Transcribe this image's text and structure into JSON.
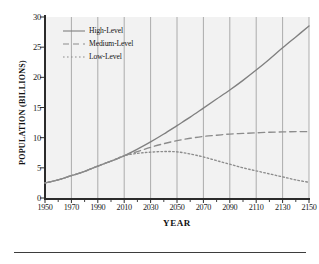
{
  "chart_data": {
    "type": "line",
    "title": "",
    "xlabel": "Year",
    "ylabel": "Population (Billions)",
    "xlim": [
      1950,
      2150
    ],
    "ylim": [
      0,
      30
    ],
    "xticks": [
      1950,
      1970,
      1990,
      2010,
      2030,
      2050,
      2070,
      2090,
      2110,
      2130,
      2150
    ],
    "xtick_labels": [
      "1950",
      "1970",
      "1990",
      "2010",
      "2030",
      "2050",
      "2070",
      "2090",
      "2110",
      "2130",
      "2150"
    ],
    "yticks": [
      0,
      5,
      10,
      15,
      20,
      25,
      30
    ],
    "ytick_labels": [
      "0",
      "5",
      "10",
      "15",
      "20",
      "25",
      "30"
    ],
    "minor_xtick_interval": 10,
    "grid": "vertical-only",
    "grid_color": "#999999",
    "plot_background": "#f2f2f2",
    "legend_position": "upper-left-inside",
    "x": [
      1950,
      1960,
      1970,
      1980,
      1990,
      2000,
      2010,
      2020,
      2030,
      2040,
      2050,
      2060,
      2070,
      2080,
      2090,
      2100,
      2110,
      2120,
      2130,
      2140,
      2150
    ],
    "series": [
      {
        "name": "High-Level",
        "style": "solid",
        "color": "#808080",
        "values": [
          2.5,
          3.0,
          3.7,
          4.4,
          5.3,
          6.1,
          7.0,
          8.1,
          9.3,
          10.6,
          12.0,
          13.4,
          14.9,
          16.4,
          17.9,
          19.5,
          21.2,
          23.0,
          24.9,
          26.7,
          28.5
        ]
      },
      {
        "name": "Medium-Level",
        "style": "dashed",
        "color": "#8c8c8c",
        "values": [
          2.5,
          3.0,
          3.7,
          4.4,
          5.3,
          6.1,
          7.0,
          7.7,
          8.4,
          9.0,
          9.5,
          9.9,
          10.2,
          10.4,
          10.6,
          10.7,
          10.8,
          10.9,
          10.95,
          11.0,
          11.0
        ]
      },
      {
        "name": "Low-Level",
        "style": "dotted",
        "color": "#8c8c8c",
        "values": [
          2.5,
          3.0,
          3.7,
          4.4,
          5.3,
          6.1,
          7.0,
          7.4,
          7.6,
          7.7,
          7.65,
          7.3,
          6.8,
          6.2,
          5.6,
          5.0,
          4.5,
          4.0,
          3.5,
          3.0,
          2.6
        ]
      }
    ]
  },
  "legend": {
    "items": [
      {
        "label": "High-Level"
      },
      {
        "label": "Medium-Level"
      },
      {
        "label": "Low-Level"
      }
    ]
  },
  "axes": {
    "y_title": "POPULATION (BILLIONS)",
    "x_title": "YEAR"
  }
}
